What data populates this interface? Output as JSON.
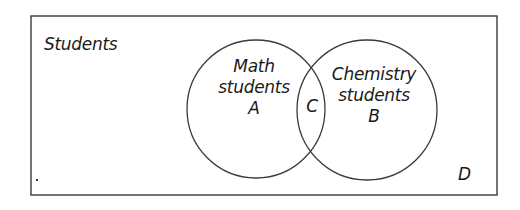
{
  "diagram": {
    "type": "venn",
    "universe": {
      "label": "Students",
      "region_label": "D"
    },
    "sets": [
      {
        "name": "Math students",
        "lines": [
          "Math",
          "students"
        ],
        "region_label": "A"
      },
      {
        "name": "Chemistry students",
        "lines": [
          "Chemistry",
          "students"
        ],
        "region_label": "B"
      }
    ],
    "intersection": {
      "region_label": "C"
    },
    "colors": {
      "stroke": "#3a3a3a",
      "text": "#1a1a1a",
      "background": "#ffffff"
    }
  }
}
